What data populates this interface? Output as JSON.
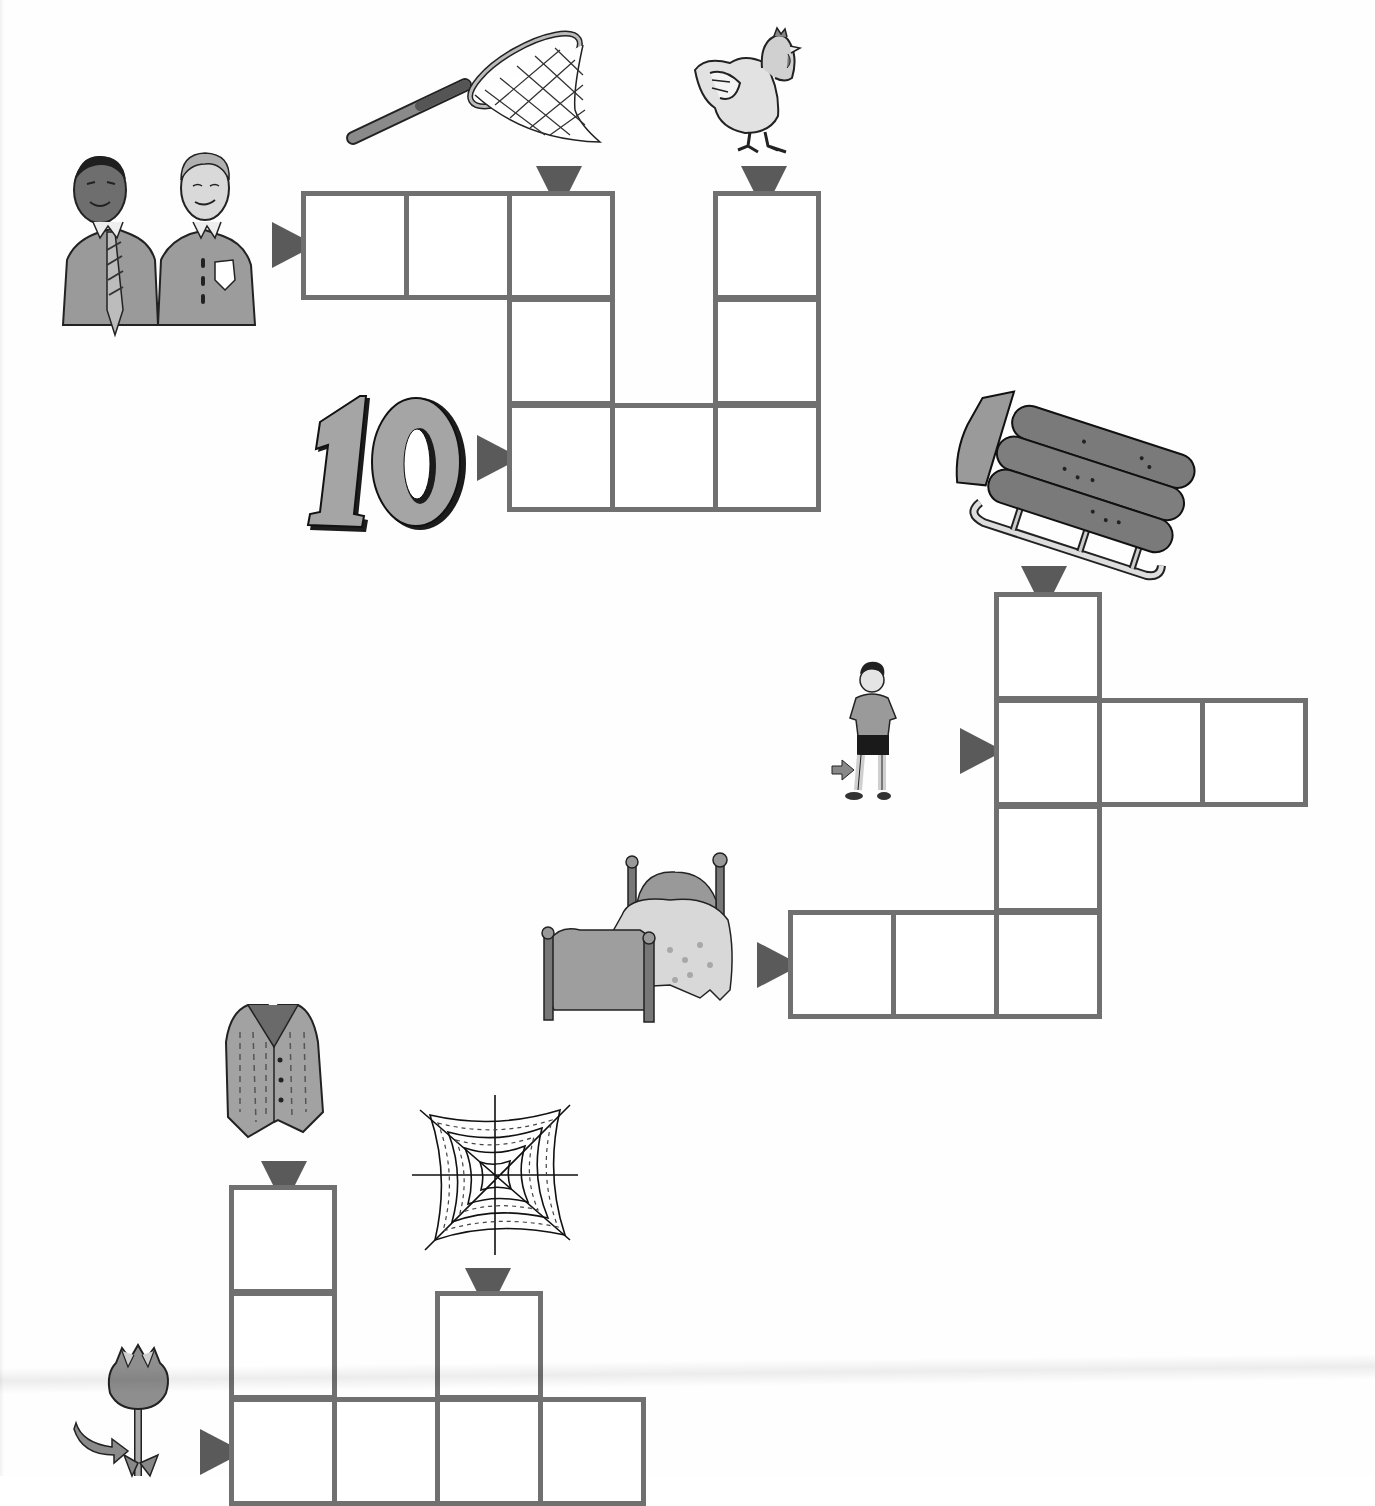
{
  "page": {
    "type": "picture crossword worksheet",
    "cell_size_px": 103,
    "colors": {
      "grid_line": "#707070",
      "arrow": "#5a5a5a",
      "background": "#fefefe",
      "illustration_fill": "#a8a8a8"
    }
  },
  "puzzles": [
    {
      "id": "puzzle-1",
      "clues": [
        {
          "picture": "two-men-icon",
          "meaning": "men",
          "direction": "across",
          "row": 0,
          "col": 0,
          "length": 3
        },
        {
          "picture": "butterfly-net-icon",
          "meaning": "net",
          "direction": "down",
          "row": 0,
          "col": 2,
          "length": 3
        },
        {
          "picture": "hen-icon",
          "meaning": "hen",
          "direction": "down",
          "row": 0,
          "col": 4,
          "length": 3
        },
        {
          "picture": "number-ten-icon",
          "meaning": "ten",
          "label": "10",
          "direction": "across",
          "row": 2,
          "col": 2,
          "length": 3
        }
      ],
      "cells": [
        {
          "r": 0,
          "c": 0,
          "value": ""
        },
        {
          "r": 0,
          "c": 1,
          "value": ""
        },
        {
          "r": 0,
          "c": 2,
          "value": ""
        },
        {
          "r": 0,
          "c": 4,
          "value": ""
        },
        {
          "r": 1,
          "c": 2,
          "value": ""
        },
        {
          "r": 1,
          "c": 4,
          "value": ""
        },
        {
          "r": 2,
          "c": 2,
          "value": ""
        },
        {
          "r": 2,
          "c": 3,
          "value": ""
        },
        {
          "r": 2,
          "c": 4,
          "value": ""
        }
      ]
    },
    {
      "id": "puzzle-2",
      "clues": [
        {
          "picture": "sled-icon",
          "meaning": "sled",
          "direction": "down",
          "row": 0,
          "col": 2,
          "length": 4
        },
        {
          "picture": "boy-legs-icon",
          "meaning": "leg",
          "direction": "across",
          "row": 1,
          "col": 2,
          "length": 3
        },
        {
          "picture": "bed-icon",
          "meaning": "bed",
          "direction": "across",
          "row": 3,
          "col": 0,
          "length": 3
        }
      ],
      "cells": [
        {
          "r": 0,
          "c": 2,
          "value": ""
        },
        {
          "r": 1,
          "c": 2,
          "value": ""
        },
        {
          "r": 1,
          "c": 3,
          "value": ""
        },
        {
          "r": 1,
          "c": 4,
          "value": ""
        },
        {
          "r": 2,
          "c": 2,
          "value": ""
        },
        {
          "r": 3,
          "c": 0,
          "value": ""
        },
        {
          "r": 3,
          "c": 1,
          "value": ""
        },
        {
          "r": 3,
          "c": 2,
          "value": ""
        }
      ]
    },
    {
      "id": "puzzle-3",
      "clues": [
        {
          "picture": "vest-icon",
          "meaning": "vest",
          "direction": "down",
          "row": 0,
          "col": 0,
          "length": 3
        },
        {
          "picture": "spider-web-icon",
          "meaning": "web",
          "direction": "down",
          "row": 1,
          "col": 2,
          "length": 2
        },
        {
          "picture": "tulip-stem-icon",
          "meaning": "stem",
          "direction": "across",
          "row": 2,
          "col": 0,
          "length": 4
        }
      ],
      "cells": [
        {
          "r": 0,
          "c": 0,
          "value": ""
        },
        {
          "r": 1,
          "c": 0,
          "value": ""
        },
        {
          "r": 1,
          "c": 2,
          "value": ""
        },
        {
          "r": 2,
          "c": 0,
          "value": ""
        },
        {
          "r": 2,
          "c": 1,
          "value": ""
        },
        {
          "r": 2,
          "c": 2,
          "value": ""
        },
        {
          "r": 2,
          "c": 3,
          "value": ""
        }
      ]
    }
  ],
  "labels": {
    "number_ten": "10"
  }
}
